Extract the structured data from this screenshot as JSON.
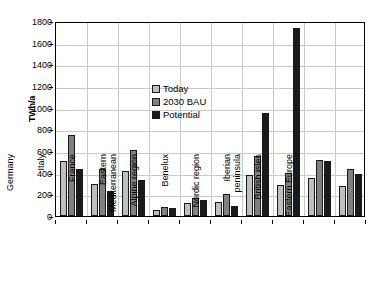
{
  "chart_data": {
    "type": "bar",
    "title": "",
    "xlabel": "",
    "ylabel": "TWh/a",
    "ylim": [
      0,
      1800
    ],
    "ytick_step": 200,
    "yticks": [
      0,
      200,
      400,
      600,
      800,
      1000,
      1200,
      1400,
      1600,
      1800
    ],
    "grid": true,
    "legend_position": "inside-top-left",
    "categories": [
      "Germany",
      "Italy",
      "France",
      "Eastern Mediterranean",
      "Alpine region",
      "Benelux",
      "Nordic region",
      "Iberian peninsula",
      "British isles",
      "Eastern Europe"
    ],
    "category_lines": [
      [
        "Germany"
      ],
      [
        "Italy"
      ],
      [
        "France"
      ],
      [
        "Eastern",
        "Mediterranean"
      ],
      [
        "Alpine region"
      ],
      [
        "Benelux"
      ],
      [
        "Nordic region"
      ],
      [
        "Iberian",
        "peninsula"
      ],
      [
        "British isles"
      ],
      [
        "Eastern Europe"
      ]
    ],
    "series": [
      {
        "name": "Today",
        "color": "#bfbfbf",
        "values": [
          510,
          295,
          415,
          55,
          120,
          130,
          380,
          290,
          350,
          280
        ]
      },
      {
        "name": "2030 BAU",
        "color": "#808080",
        "values": [
          750,
          430,
          605,
          80,
          165,
          200,
          550,
          400,
          520,
          430
        ]
      },
      {
        "name": "Potential",
        "color": "#1a1a1a",
        "values": [
          430,
          230,
          330,
          75,
          145,
          90,
          950,
          1740,
          510,
          390
        ]
      }
    ]
  },
  "legend": {
    "items": [
      {
        "label": "Today",
        "color": "#bfbfbf"
      },
      {
        "label": "2030 BAU",
        "color": "#808080"
      },
      {
        "label": "Potential",
        "color": "#1a1a1a"
      }
    ]
  },
  "axis": {
    "y_title": "TWh/a"
  }
}
